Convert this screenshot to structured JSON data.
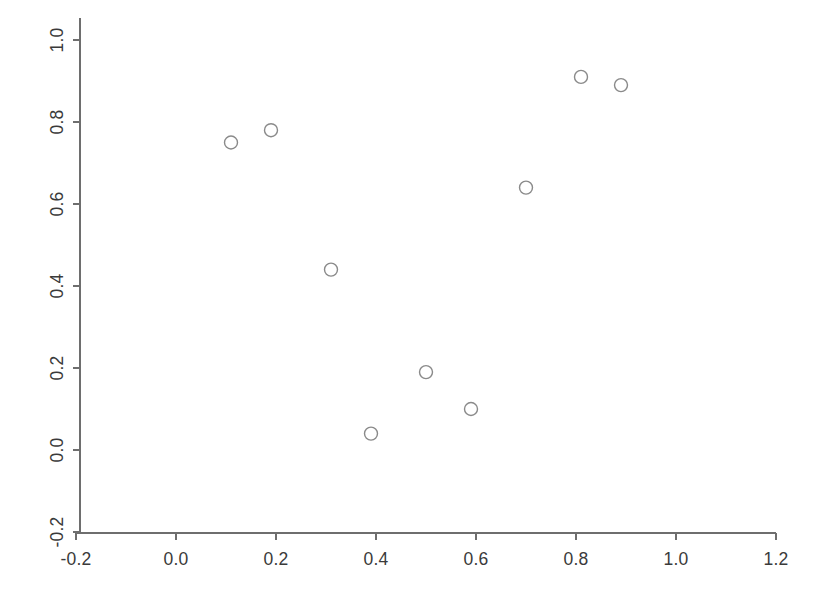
{
  "chart_data": {
    "type": "scatter",
    "title": "",
    "subtitle": "",
    "xlabel": "",
    "ylabel": "",
    "xlim": [
      -0.2,
      1.2
    ],
    "ylim": [
      -0.2,
      1.05
    ],
    "grid": false,
    "legend": null,
    "marker": {
      "shape": "circle-open",
      "size_px": 13,
      "stroke_color": "#8a8a8a",
      "fill": "none"
    },
    "axis_color": "#6e6e6e",
    "background_color": "#ffffff",
    "xticks": [
      -0.2,
      0.0,
      0.2,
      0.4,
      0.6,
      0.8,
      1.0,
      1.2
    ],
    "xticklabels": [
      "-0.2",
      "0.0",
      "0.2",
      "0.4",
      "0.6",
      "0.8",
      "1.0",
      "1.2"
    ],
    "yticks": [
      -0.2,
      0.0,
      0.2,
      0.4,
      0.6,
      0.8,
      1.0
    ],
    "yticklabels": [
      "-0.2",
      "0.0",
      "0.2",
      "0.4",
      "0.6",
      "0.8",
      "1.0"
    ],
    "ytick_label_rotation_deg": 90,
    "x": [
      0.11,
      0.19,
      0.31,
      0.39,
      0.5,
      0.59,
      0.7,
      0.81,
      0.89
    ],
    "y": [
      0.75,
      0.78,
      0.44,
      0.04,
      0.19,
      0.1,
      0.64,
      0.91,
      0.89
    ],
    "points": [
      {
        "x": 0.11,
        "y": 0.75
      },
      {
        "x": 0.19,
        "y": 0.78
      },
      {
        "x": 0.31,
        "y": 0.44
      },
      {
        "x": 0.39,
        "y": 0.04
      },
      {
        "x": 0.5,
        "y": 0.19
      },
      {
        "x": 0.59,
        "y": 0.1
      },
      {
        "x": 0.7,
        "y": 0.64
      },
      {
        "x": 0.81,
        "y": 0.91
      },
      {
        "x": 0.89,
        "y": 0.89
      }
    ]
  },
  "plot_geometry": {
    "origin_px": {
      "x": 176,
      "y": 450
    },
    "x_unit_px": 500,
    "y_unit_px": 410,
    "x_axis_y_px": 533,
    "y_axis_x_px": 80,
    "x_axis_start_px": 76,
    "x_axis_end_px": 776,
    "y_axis_top_px": 18,
    "tick_length_px": 7
  }
}
